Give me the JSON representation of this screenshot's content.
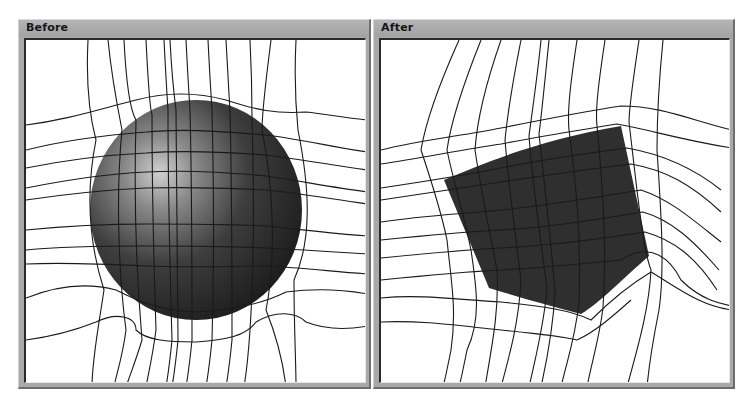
{
  "panels": [
    {
      "id": "before",
      "title": "Before",
      "object": "sphere",
      "object_color": "#2e2e2e",
      "highlight_color": "#bdbdbd",
      "grid_line_color": "#1a1a1a"
    },
    {
      "id": "after",
      "title": "After",
      "object": "cube",
      "object_color": "#2f2f2f",
      "grid_line_color": "#1a1a1a"
    }
  ],
  "colors": {
    "titlebar": "#a9a9a9",
    "canvas_background": "#ffffff",
    "frame_dark": "#2a2a2a"
  }
}
